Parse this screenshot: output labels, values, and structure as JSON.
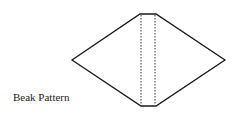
{
  "caption": "Beak Pattern",
  "colors": {
    "outline": "#1a1a1a",
    "fold_line": "#333333",
    "text": "#222222",
    "background": "#ffffff"
  }
}
